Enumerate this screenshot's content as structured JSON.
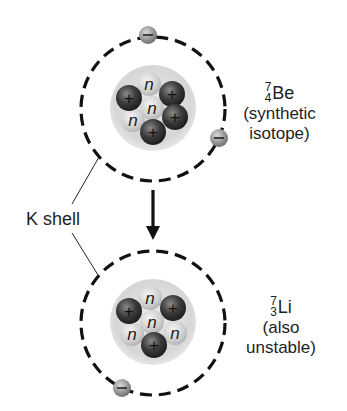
{
  "diagram": {
    "colors": {
      "background": "#ffffff",
      "orbit": "#111111",
      "nucleus_halo": "#d8d8d8",
      "proton": "#3a3a3a",
      "neutron": "#c8c8c8",
      "electron": "#9a9a9a"
    },
    "upper_atom": {
      "mass_number": "7",
      "atomic_number": "4",
      "symbol": "Be",
      "note_line1": "(synthetic",
      "note_line2": "isotope)",
      "protons": 4,
      "neutrons": 3,
      "electrons": 2,
      "proton_sign": "+",
      "neutron_sign": "n",
      "electron_sign": "−"
    },
    "lower_atom": {
      "mass_number": "7",
      "atomic_number": "3",
      "symbol": "Li",
      "note_line1": "(also",
      "note_line2": "unstable)",
      "protons": 3,
      "neutrons": 4,
      "electrons": 1,
      "proton_sign": "+",
      "neutron_sign": "n",
      "electron_sign": "−"
    },
    "shell_label": "K shell",
    "arrow": "down"
  }
}
